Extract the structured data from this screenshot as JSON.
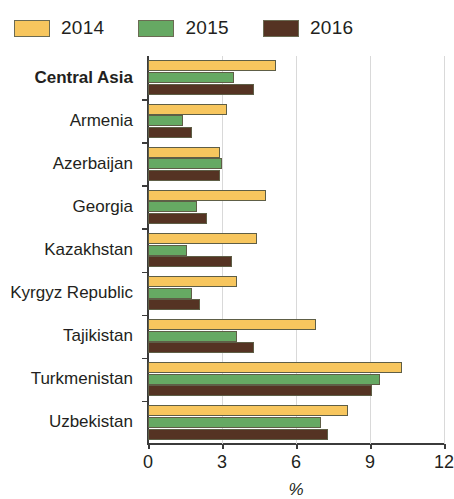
{
  "legend": {
    "items": [
      {
        "label": "2014",
        "color": "#F7C65E",
        "icon": "legend-swatch-2014"
      },
      {
        "label": "2015",
        "color": "#66A963",
        "icon": "legend-swatch-2015"
      },
      {
        "label": "2016",
        "color": "#553323",
        "icon": "legend-swatch-2016"
      }
    ]
  },
  "chart_data": {
    "type": "bar",
    "orientation": "horizontal",
    "title": "",
    "xlabel": "%",
    "ylabel": "",
    "xlim": [
      0,
      12
    ],
    "xticks": [
      0,
      3,
      6,
      9,
      12
    ],
    "xtick_labels": [
      "0",
      "3",
      "6",
      "9",
      "12"
    ],
    "grid": true,
    "grid_axis": "x",
    "legend_position": "top-left",
    "categories": [
      "Central Asia",
      "Armenia",
      "Azerbaijan",
      "Georgia",
      "Kazakhstan",
      "Kyrgyz Republic",
      "Tajikistan",
      "Turkmenistan",
      "Uzbekistan"
    ],
    "emphasized_categories": [
      "Central Asia"
    ],
    "series": [
      {
        "name": "2014",
        "color": "#F7C65E",
        "values": [
          5.2,
          3.2,
          2.9,
          4.8,
          4.4,
          3.6,
          6.8,
          10.3,
          8.1
        ]
      },
      {
        "name": "2015",
        "color": "#66A963",
        "values": [
          3.5,
          1.4,
          3.0,
          2.0,
          1.6,
          1.8,
          3.6,
          9.4,
          7.0
        ]
      },
      {
        "name": "2016",
        "color": "#553323",
        "values": [
          4.3,
          1.8,
          2.9,
          2.4,
          3.4,
          2.1,
          4.3,
          9.1,
          7.3
        ]
      }
    ]
  }
}
